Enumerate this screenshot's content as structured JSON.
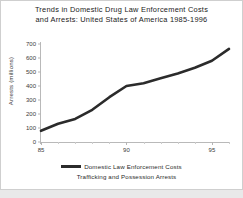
{
  "figure": {
    "title_line1": "Trends in Domestic Drug Law Enforcement Costs",
    "title_line2": "and Arrests: United States of America 1985-1996",
    "background": "#ffffff",
    "series_color": "#2b2b2b",
    "axis_color": "#b9b9b9"
  },
  "legend": {
    "entry1": "Domestic Law Enforcement Costs",
    "entry2": "Trafficking and Possession Arrests"
  },
  "chart_data": {
    "type": "line",
    "title": "Trends in Domestic Drug Law Enforcement Costs and Arrests: United States of America 1985-1996",
    "xlabel": "",
    "ylabel": "Arrests (millions)",
    "xlim": [
      85,
      96
    ],
    "ylim": [
      0,
      700
    ],
    "grid": false,
    "legend_position": "bottom",
    "x_ticks": [
      85,
      90,
      95
    ],
    "x_tick_labels": [
      "85",
      "90",
      "95"
    ],
    "x_minor_ticks": [
      86,
      87,
      88,
      89,
      91,
      92,
      93,
      94,
      96
    ],
    "y_ticks": [
      0,
      100,
      200,
      300,
      400,
      500,
      600,
      700
    ],
    "y_tick_labels": [
      "0",
      "100",
      "200",
      "300",
      "400",
      "500",
      "600",
      "700"
    ],
    "series": [
      {
        "name": "Domestic Law Enforcement Costs",
        "color": "#2b2b2b",
        "x": [
          85,
          86,
          87,
          88,
          89,
          90,
          91,
          92,
          93,
          94,
          95,
          96
        ],
        "values": [
          80,
          130,
          165,
          230,
          320,
          400,
          420,
          455,
          490,
          530,
          580,
          665
        ]
      }
    ]
  }
}
